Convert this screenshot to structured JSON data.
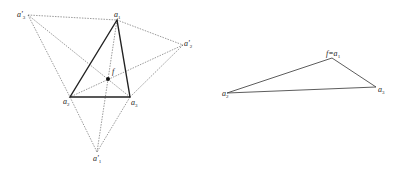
{
  "left_figure": {
    "points": {
      "a1": {
        "x": 117,
        "y": 20,
        "label": "a",
        "sub": "1"
      },
      "a2": {
        "x": 70,
        "y": 97,
        "label": "a",
        "sub": "2"
      },
      "a3": {
        "x": 130,
        "y": 97,
        "label": "a",
        "sub": "3"
      },
      "a1p": {
        "x": 97,
        "y": 152,
        "label": "a'",
        "sub": "1"
      },
      "a2p": {
        "x": 183,
        "y": 45,
        "label": "a'",
        "sub": "2"
      },
      "a3p": {
        "x": 28,
        "y": 15,
        "label": "a'",
        "sub": "3"
      },
      "f": {
        "x": 108,
        "y": 79,
        "label": "f"
      }
    }
  },
  "right_figure": {
    "points": {
      "fa1": {
        "x": 332,
        "y": 58,
        "label": "f=a",
        "sub": "1"
      },
      "a2": {
        "x": 227,
        "y": 93,
        "label": "a",
        "sub": "2"
      },
      "a3": {
        "x": 376,
        "y": 87,
        "label": "a",
        "sub": "3"
      }
    }
  }
}
